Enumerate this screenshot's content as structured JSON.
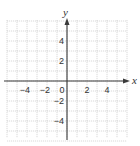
{
  "chart_data": {
    "type": "line",
    "title": "",
    "xlabel": "x",
    "ylabel": "y",
    "xlim": [
      -6,
      6
    ],
    "ylim": [
      -6,
      6
    ],
    "grid": true,
    "grid_step": 1,
    "x_ticks": [
      -4,
      -2,
      0,
      2,
      4
    ],
    "y_ticks": [
      4,
      2,
      -2,
      -4
    ],
    "x_tick_labels": [
      "−4",
      "−2",
      "0",
      "2",
      "4"
    ],
    "y_tick_labels": [
      "4",
      "2",
      "−2",
      "−4"
    ],
    "series": [],
    "legend": null
  },
  "axes": {
    "x_label": "x",
    "y_label": "y",
    "origin_label": "0"
  },
  "colors": {
    "grid": "#c8c8c8",
    "axis": "#3a3a3a",
    "text": "#333333"
  }
}
